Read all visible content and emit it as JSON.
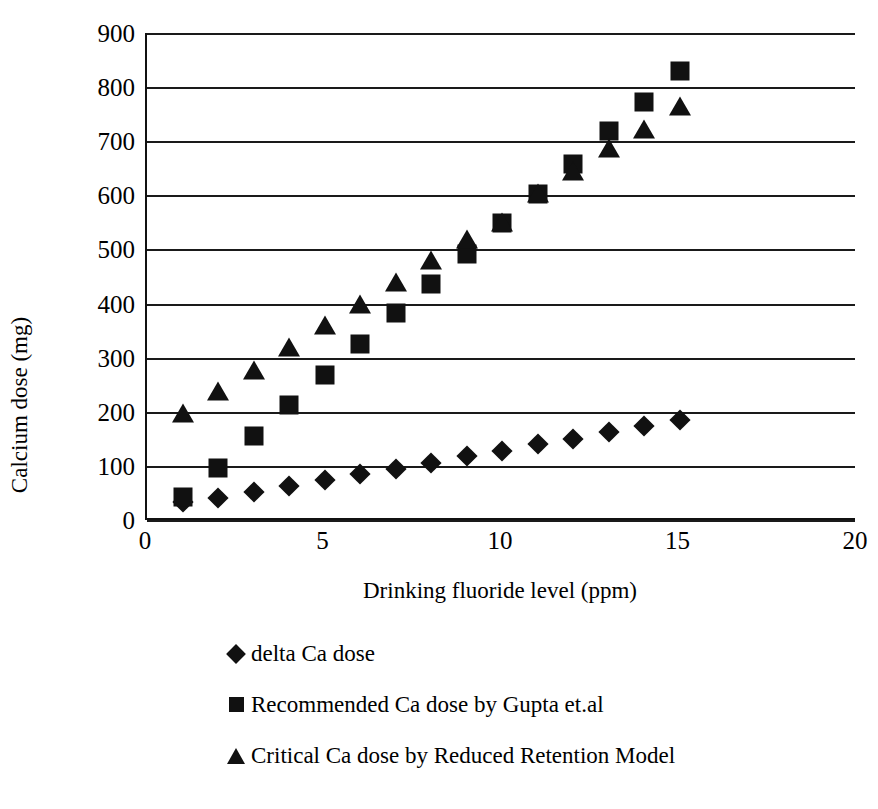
{
  "chart_data": {
    "type": "scatter",
    "title": "",
    "xlabel": "Drinking fluoride level (ppm)",
    "ylabel": "Calcium dose (mg)",
    "xlim": [
      0,
      20
    ],
    "ylim": [
      0,
      900
    ],
    "xticks": [
      "0",
      "5",
      "10",
      "15",
      "20"
    ],
    "yticks": [
      "0",
      "100",
      "200",
      "300",
      "400",
      "500",
      "600",
      "700",
      "800",
      "900"
    ],
    "grid": "horizontal",
    "legend_position": "below",
    "x": [
      1,
      2,
      3,
      4,
      5,
      6,
      7,
      8,
      9,
      10,
      11,
      12,
      13,
      14,
      15
    ],
    "series": [
      {
        "name": "delta Ca dose",
        "marker": "diamond",
        "color": "#111111",
        "values": [
          33,
          40,
          52,
          63,
          73,
          85,
          95,
          105,
          118,
          128,
          140,
          150,
          162,
          173,
          185
        ]
      },
      {
        "name": "Recommended Ca dose by Gupta et.al",
        "marker": "square",
        "color": "#111111",
        "values": [
          43,
          97,
          155,
          212,
          268,
          325,
          382,
          437,
          492,
          548,
          603,
          658,
          718,
          773,
          830
        ]
      },
      {
        "name": "Critical Ca dose by Reduced Retention Model",
        "marker": "triangle",
        "color": "#111111",
        "values": [
          197,
          238,
          278,
          320,
          360,
          400,
          440,
          480,
          520,
          550,
          605,
          645,
          687,
          723,
          765
        ]
      }
    ]
  },
  "legend": {
    "items": [
      {
        "label": "delta Ca dose",
        "marker": "diamond"
      },
      {
        "label": "Recommended Ca dose by Gupta et.al",
        "marker": "square"
      },
      {
        "label": "Critical Ca dose by Reduced Retention Model",
        "marker": "triangle"
      }
    ]
  }
}
